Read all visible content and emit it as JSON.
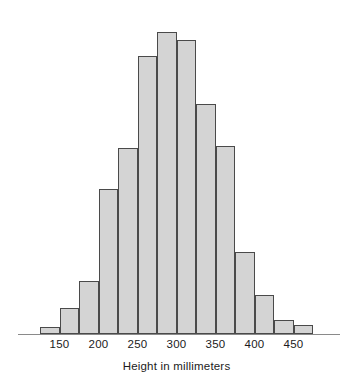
{
  "chart_data": {
    "type": "bar",
    "title": "",
    "subtitle": "",
    "xlabel": "Height in millimeters",
    "ylabel": "",
    "grid": false,
    "legend": null,
    "orientation": "vertical",
    "bin_width": 25,
    "bin_start": 125,
    "bin_end": 475,
    "xlim": [
      125,
      475
    ],
    "ylim": [
      0,
      310
    ],
    "xticks": [
      150,
      200,
      250,
      300,
      350,
      400,
      450
    ],
    "xtick_labels": [
      "150",
      "200",
      "250",
      "300",
      "350",
      "400",
      "450"
    ],
    "yticks": [],
    "ytick_labels": [],
    "categories": [
      "125-150",
      "150-175",
      "175-200",
      "200-225",
      "225-250",
      "250-275",
      "275-300",
      "300-325",
      "325-350",
      "350-375",
      "375-400",
      "400-425",
      "425-450",
      "450-475"
    ],
    "bin_edges": [
      125,
      150,
      175,
      200,
      225,
      250,
      275,
      300,
      325,
      350,
      375,
      400,
      425,
      450,
      475
    ],
    "values": [
      7,
      26,
      53,
      145,
      186,
      278,
      302,
      294,
      230,
      188,
      82,
      39,
      14,
      9
    ],
    "colors": {
      "bar_fill": "#d4d4d4",
      "bar_edge": "#4a4a4a",
      "axis": "#8a8a8a",
      "text": "#1b1b1b",
      "background": "#ffffff"
    }
  }
}
